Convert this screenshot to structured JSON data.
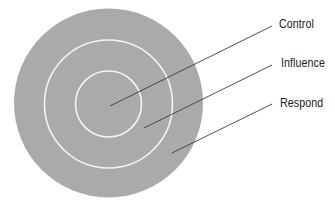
{
  "diagram": {
    "type": "concentric-circles",
    "colors": {
      "background": "#ffffff",
      "fill": "#aaaaaa",
      "ring_stroke": "#f4f4f4",
      "leader_line": "#3c3c3c",
      "text": "#222222"
    },
    "circles": [
      {
        "name": "Respond",
        "cx": 108.5,
        "cy": 103,
        "r": 94.5
      },
      {
        "name": "Influence",
        "cx": 108.5,
        "cy": 104,
        "r": 64
      },
      {
        "name": "Control",
        "cx": 108.5,
        "cy": 104,
        "r": 33
      }
    ],
    "labels": [
      {
        "text": "Control",
        "x": 279,
        "y": 17,
        "line": {
          "x1": 110,
          "y1": 106,
          "x2": 272,
          "y2": 26
        }
      },
      {
        "text": "Influence",
        "x": 281,
        "y": 56,
        "line": {
          "x1": 144,
          "y1": 128,
          "x2": 272,
          "y2": 65
        }
      },
      {
        "text": "Respond",
        "x": 280,
        "y": 96,
        "line": {
          "x1": 172,
          "y1": 153,
          "x2": 272,
          "y2": 104
        }
      }
    ]
  }
}
